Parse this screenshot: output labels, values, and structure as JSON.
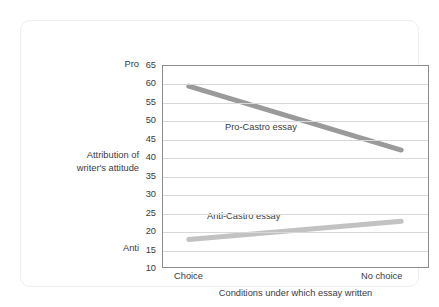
{
  "chart_data": {
    "type": "line",
    "title": "",
    "xlabel": "Conditions under which essay written",
    "ylabel": "Attribution of\nwriter's attitude",
    "categories": [
      "Choice",
      "No choice"
    ],
    "x_tick_labels": [
      "Choice",
      "No choice"
    ],
    "y_ticks": [
      10,
      15,
      20,
      25,
      30,
      35,
      40,
      45,
      50,
      55,
      60,
      65
    ],
    "y_tick_labels": [
      "10",
      "15",
      "20",
      "25",
      "30",
      "35",
      "40",
      "45",
      "50",
      "55",
      "60",
      "65"
    ],
    "ylim": [
      10,
      65
    ],
    "y_axis_endpoint_labels": {
      "high": "Pro",
      "low": "Anti"
    },
    "grid": "horizontal",
    "legend": "inline-annotations",
    "series": [
      {
        "name": "Pro-Castro essay",
        "values": [
          59.5,
          42
        ],
        "color": "#9a9a9a",
        "label_text": "Pro-Castro essay"
      },
      {
        "name": "Anti-Castro essay",
        "values": [
          17.5,
          22.5
        ],
        "color": "#c2c2c2",
        "label_text": "Anti-Castro essay"
      }
    ]
  },
  "colors": {
    "series_pro": "#9a9a9a",
    "series_anti": "#c2c2c2",
    "gridline": "#d6d9dc",
    "frame": "#8c8c8c",
    "text": "#3b3b3b",
    "card_border": "#eceef0",
    "background": "#ffffff"
  }
}
